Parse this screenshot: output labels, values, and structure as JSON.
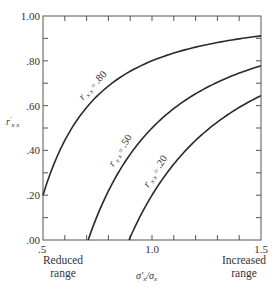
{
  "chart_data": {
    "type": "line",
    "title": "",
    "xlabel": "σ'x/σx",
    "ylabel": "r'xx",
    "xlim": [
      0.5,
      1.5
    ],
    "ylim": [
      0.0,
      1.0
    ],
    "x_ticks": [
      0.5,
      0.6,
      0.7,
      0.8,
      0.9,
      1.0,
      1.1,
      1.2,
      1.3,
      1.4,
      1.5
    ],
    "x_tick_labels": [
      ".5",
      "",
      "",
      "",
      "",
      "1.0",
      "",
      "",
      "",
      "",
      "1.5"
    ],
    "y_ticks": [
      0.0,
      0.1,
      0.2,
      0.3,
      0.4,
      0.5,
      0.6,
      0.7,
      0.8,
      0.9,
      1.0
    ],
    "y_tick_labels": [
      ".00",
      "",
      ".20",
      "",
      ".40",
      "",
      ".60",
      "",
      ".80",
      "",
      "1.00"
    ],
    "grid": false,
    "annotations": {
      "left": [
        "Reduced",
        "range"
      ],
      "right": [
        "Increased",
        "range"
      ]
    },
    "series": [
      {
        "name": "rxx = .80",
        "label_prefix": "r",
        "label_sub": "x x",
        "label_eq": "=",
        "label_value": ".80",
        "rxx": 0.8,
        "x": [
          0.5,
          0.6,
          0.7,
          0.8,
          0.9,
          1.0,
          1.1,
          1.2,
          1.3,
          1.4,
          1.5
        ],
        "y": [
          0.2,
          0.444,
          0.592,
          0.688,
          0.753,
          0.8,
          0.835,
          0.861,
          0.882,
          0.898,
          0.911
        ]
      },
      {
        "name": "rxx = .50",
        "label_prefix": "r",
        "label_sub": "x x",
        "label_eq": "=",
        "label_value": ".50",
        "rxx": 0.5,
        "x": [
          0.707,
          0.8,
          0.9,
          1.0,
          1.1,
          1.2,
          1.3,
          1.4,
          1.5
        ],
        "y": [
          0.0,
          0.219,
          0.383,
          0.5,
          0.587,
          0.653,
          0.704,
          0.745,
          0.778
        ]
      },
      {
        "name": "rxx = .20",
        "label_prefix": "r",
        "label_sub": "x x",
        "label_eq": "=",
        "label_value": ".20",
        "rxx": 0.2,
        "x": [
          0.894,
          1.0,
          1.1,
          1.2,
          1.3,
          1.4,
          1.5
        ],
        "y": [
          0.0,
          0.2,
          0.339,
          0.444,
          0.527,
          0.592,
          0.644
        ]
      }
    ]
  }
}
